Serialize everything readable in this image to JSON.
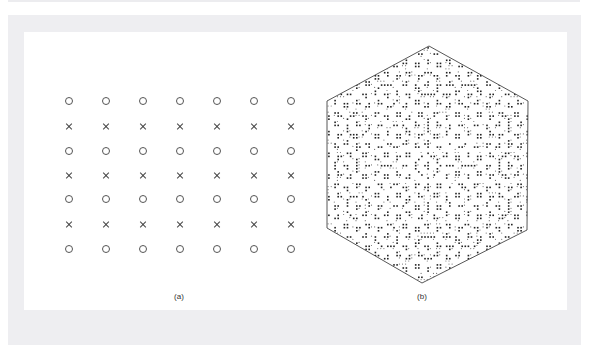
{
  "figure": {
    "panel_a": {
      "caption": "(a)",
      "caption_pos": [
        179,
        292
      ],
      "columns_x": [
        69,
        106,
        143,
        180,
        217,
        254,
        291
      ],
      "rows": [
        {
          "y": 101,
          "marker": "o"
        },
        {
          "y": 126,
          "marker": "x"
        },
        {
          "y": 151,
          "marker": "o"
        },
        {
          "y": 175,
          "marker": "x"
        },
        {
          "y": 199,
          "marker": "o"
        },
        {
          "y": 224,
          "marker": "x"
        },
        {
          "y": 249,
          "marker": "o"
        }
      ]
    },
    "panel_b": {
      "caption": "(b)",
      "caption_pos": [
        422,
        292
      ],
      "shape": "hexagon",
      "vertices": [
        [
          429,
          46
        ],
        [
          528,
          101
        ],
        [
          527,
          230
        ],
        [
          422,
          283
        ],
        [
          327,
          228
        ],
        [
          327,
          101
        ]
      ],
      "fill": "quasicrystal dot pattern",
      "stroke": "#444444"
    }
  }
}
